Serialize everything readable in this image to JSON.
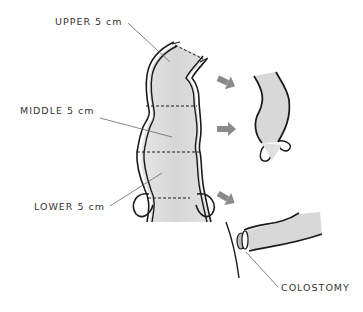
{
  "labels": {
    "upper": "UPPER 5 cm",
    "middle": "MIDDLE 5 cm",
    "lower": "LOWER 5 cm",
    "colostomy": "COLOSTOMY"
  },
  "colors": {
    "fill": "#dcdcdc",
    "outline": "#1a1a1a",
    "arrow": "#8a8a8a",
    "leader": "#666666"
  }
}
